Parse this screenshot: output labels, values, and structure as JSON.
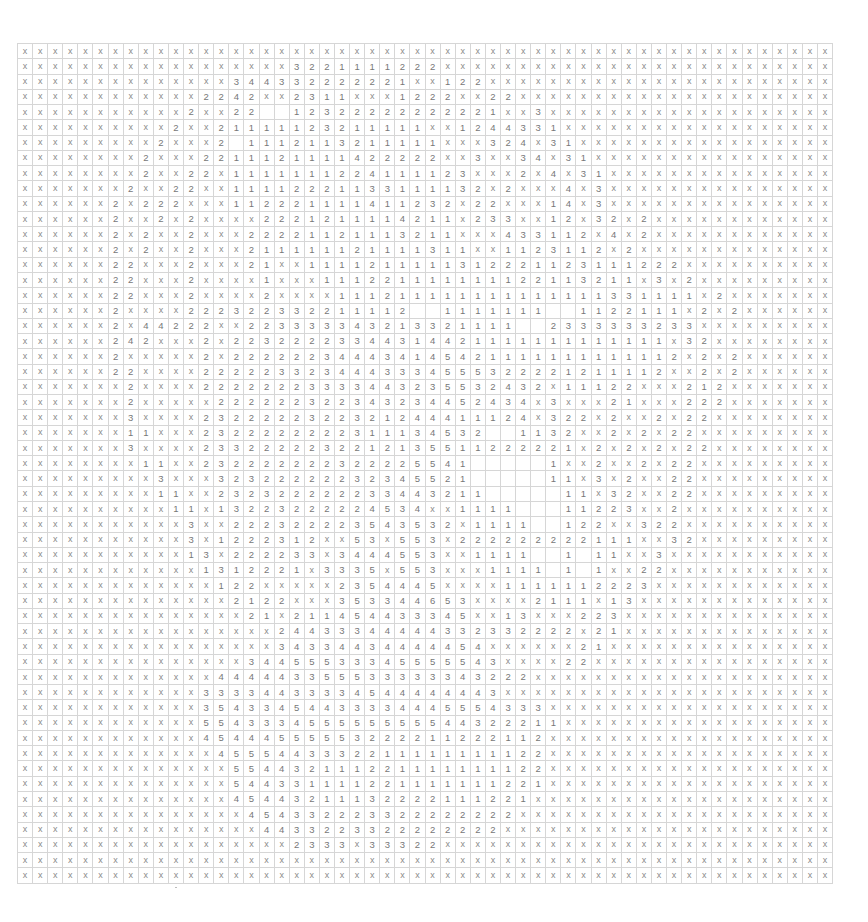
{
  "grid": {
    "columns": 54,
    "rows_count": 55,
    "empty_token": "_",
    "rows": [
      "x x x x x x x x x x x x x x x x x x x x x x x x x x x x x x x x x x x x x x x x x x x x x x x x x x x x x x",
      "x x x x x x x x x x x x x x x x x x 3 2 2 1 1 1 1 2 2 2 x x x x x x x x x x x x x x x x x x x x x x x x x x",
      "x x x x x x x x x x x x x x 3 4 4 3 3 2 2 2 2 2 2 1 x x 1 2 2 x x x x x x x x x x x x x x x x x x x x x x x",
      "x x x x x x x x x x x x 2 2 4 2 x x 2 3 1 1 x x x 1 2 2 2 x x 2 2 x x x x x x x x x x x x x x x x x x x x x",
      "x x x x x x x x x x x 2 x x 2 2 _ _ 1 2 3 2 2 2 2 2 2 2 2 2 2 1 x x 3 x x x x x x x x x x x x x x x x x x x",
      "x x x x x x x x x x 2 x x 2 1 1 1 1 1 2 3 2 1 1 1 1 1 x x 1 2 4 4 3 3 1 x x x x x x x x x x x x x x x x x x",
      "x x x x x x x x x 2 x x x 2 _ 1 1 1 2 1 1 3 2 1 1 1 1 1 x x x 3 2 4 x 3 1 x x x x x x x x x x x x x x x x x",
      "x x x x x x x x 2 x x x 2 2 1 1 1 2 1 1 1 1 4 2 2 2 2 2 x x 3 x x 3 4 x 3 1 x x x x x x x x x x x x x x x x",
      "x x x x x x x x 2 x x 2 2 x 1 1 1 1 1 1 1 2 2 4 1 1 1 1 2 3 x x x 2 x 4 x 3 1 x x x x x x x x x x x x x x x",
      "x x x x x x x 2 x x 2 2 x x 1 1 1 1 2 2 2 1 1 3 3 1 1 1 1 3 2 x 2 x x x 4 x 3 x x x x x x x x x x x x x x x",
      "x x x x x x 2 x 2 2 2 x x x 1 1 2 2 2 1 1 1 1 4 1 1 2 3 2 x 2 2 x x x 1 4 x 3 x x x x x x x x x x x x x x x",
      "x x x x x x 2 x x 2 x 2 x x x x 2 2 2 1 2 1 1 1 1 4 2 1 1 x 2 3 3 x x 1 2 x 3 2 x 2 x x x x x x x x x x x x",
      "x x x x x x 2 x 2 x x 2 x x x 2 2 2 2 1 1 2 1 1 1 3 2 1 1 x x x 4 3 3 1 1 2 x 4 x 2 x x x x x x x x x x x x",
      "x x x x x x 2 x 2 x x 2 x x x 2 1 1 1 1 1 1 2 1 1 1 1 3 1 1 x x 1 1 2 3 1 1 2 x 2 x x x x x x x x x x x x x",
      "x x x x x x 2 2 x x x 2 x x x 2 1 x x 1 1 1 1 2 1 1 1 1 1 3 1 2 2 2 1 1 2 3 1 1 1 2 2 2 x x x x x x x x x x",
      "x x x x x x 2 2 x x x 2 x x x x 1 x x x 1 1 1 2 2 1 1 1 1 1 1 1 1 2 2 1 1 3 2 1 1 x 3 x 2 x x x x x x x x x",
      "x x x x x x 2 2 x x x 2 x x x x 2 x x x x 1 1 1 2 1 1 1 1 1 1 1 1 1 1 1 1 1 1 3 3 1 1 1 1 x 2 x x x x x x x",
      "x x x x x x 2 x x x x 2 2 2 3 2 2 3 3 2 2 1 1 1 1 2 _ _ 1 1 1 1 1 1 1 _ _ 1 1 2 2 1 1 1 x 2 x 2 x x x x x x",
      "x x x x x x 2 x 4 4 2 2 2 x x 2 2 3 3 3 3 3 4 3 2 1 3 3 2 1 1 1 1 _ _ 2 3 3 3 3 3 3 2 3 3 x x x x x x x x x",
      "x x x x x x 2 4 2 x x x 2 x 2 2 3 2 2 2 2 3 3 4 4 3 1 4 4 2 1 1 1 1 1 1 1 1 1 1 1 1 1 x 3 2 x x x x x x x x",
      "x x x x x x 2 x x x x x 2 x 2 2 2 2 2 2 3 4 4 4 3 4 1 4 5 4 2 1 1 1 1 1 1 1 1 1 1 1 1 2 x 2 x 2 x x x x x x",
      "x x x x x x 2 2 x x x x 2 2 2 2 2 3 3 2 3 4 4 4 3 3 3 4 5 5 5 3 2 2 2 2 1 2 1 1 1 1 2 x x 2 x 2 x x x x x x",
      "x x x x x x x 2 x x x x 2 2 2 2 2 2 2 3 3 3 3 4 4 3 2 3 5 5 3 2 4 3 2 x 1 1 1 2 2 x x x 2 1 2 x x x x x x x",
      "x x x x x x x 2 x x x x x 2 2 2 2 2 2 3 2 2 3 4 3 2 3 4 4 5 2 4 3 4 x 3 x x x 2 1 x x x 2 2 2 x x x x x x x",
      "x x x x x x x 3 x x x x 2 3 2 2 2 2 2 3 2 2 3 2 1 2 4 4 4 1 1 1 2 4 x 3 2 2 x 2 x x 2 x 2 2 x x x x x x x x",
      "x x x x x x x 1 1 x x x 2 3 2 2 2 2 2 2 2 2 3 1 1 1 3 4 5 3 2 _ _ 1 1 3 2 x x 2 x 2 x 2 2 x x x x x x x x x",
      "x x x x x x x 3 x x x x 2 3 3 2 2 2 2 2 3 2 2 1 2 1 3 5 5 1 1 2 2 2 2 2 1 x 2 x 2 x 2 x 2 2 x x x x x x x x",
      "x x x x x x x x 1 1 x x 2 3 2 2 2 2 2 2 2 3 2 2 2 2 5 5 4 1 _ _ _ _ _ 1 x x 2 x x 2 x 2 2 x x x x x x x x x",
      "x x x x x x x x x 3 x x x 3 2 3 2 2 2 2 2 2 3 2 3 4 5 5 2 1 _ _ _ _ _ 1 1 x 3 x 2 x x 2 2 x x x x x x x x x",
      "x x x x x x x x x 1 1 x x 2 3 2 3 2 2 2 2 2 2 3 3 4 4 3 2 1 1 _ _ _ _ _ 1 1 x 3 2 x x 2 2 x x x x x x x x x",
      "x x x x x x x x x x 1 1 x 1 3 2 2 3 2 2 2 2 2 4 5 3 4 x x 1 1 1 1 _ _ _ 1 1 2 2 3 x x 2 x x x x x x x x x x",
      "x x x x x x x x x x x 3 x x 2 2 2 3 2 2 2 2 3 5 4 3 5 3 2 x 1 1 1 1 _ _ 1 2 2 x x 3 2 2 x x x x x x x x x x",
      "x x x x x x x x x x x 3 x 1 2 2 2 3 1 2 x x 5 3 x 5 5 3 x 2 2 2 2 2 2 2 2 2 1 1 1 x x 3 2 x x x x x x x x x",
      "x x x x x x x x x x x 1 3 x 2 2 2 2 3 3 x 3 4 4 4 5 5 3 x x 1 1 1 1 _ _ 1 _ 1 1 x x 3 x x x x x x x x x x x",
      "x x x x x x x x x x x x 1 3 1 2 2 2 1 x 3 3 3 5 x 5 5 3 x x x 1 1 1 1 _ 1 _ 1 x x 2 2 x x x x x x x x x x x",
      "x x x x x x x x x x x x x 1 2 2 x x x x x 2 3 5 4 4 4 5 x x x x 1 1 1 1 1 1 2 2 2 3 x x x x x x x x x x x x",
      "x x x x x x x x x x x x x x 2 1 2 2 x x x 3 5 3 3 4 4 6 5 3 x x x x 2 1 1 1 x 1 3 x x x x x x x x x x x x x",
      "x x x x x x x x x x x x x x x 2 1 x 2 1 1 4 5 4 4 3 3 3 4 5 x x 1 3 x x x 2 2 3 x x x x x x x x x x x x x x",
      "x x x x x x x x x x x x x x x x x 2 4 4 3 3 3 4 4 4 4 4 3 3 2 3 3 2 2 2 2 x 2 1 x x x x x x x x x x x x x x",
      "x x x x x x x x x x x x x x x x x 3 4 3 3 4 4 3 4 4 4 4 4 5 4 x x x x x x 2 1 x x x x x x x x x x x x x x x",
      "x x x x x x x x x x x x x x x 3 4 4 5 5 5 3 3 3 4 5 5 5 5 5 4 3 x x x x 2 2 x x x x x x x x x x x x x x x x",
      "x x x x x x x x x x x x x 4 4 4 4 4 3 3 5 5 5 3 3 3 3 3 3 4 3 2 2 2 x x x x x x x x x x x x x x x x x x x x",
      "x x x x x x x x x x x x 3 3 3 3 4 4 3 3 3 3 4 5 4 4 4 4 4 4 4 3 x x x x x x x x x x x x x x x x x x x x x x",
      "x x x x x x x x x x x x 3 5 4 3 3 4 5 4 4 3 3 3 3 4 4 4 5 5 5 4 3 3 3 x x x x x x x x x x x x x x x x x x x",
      "x x x x x x x x x x x x 5 5 4 3 3 3 4 5 5 5 5 5 5 5 5 5 4 4 3 2 2 2 1 1 x x x x x x x x x x x x x x x x x x",
      "x x x x x x x x x x x x 4 5 4 4 4 5 5 5 5 5 3 2 2 2 2 1 1 2 2 2 1 1 2 x x x x x x x x x x x x x x x x x x x",
      "x x x x x x x x x x x x x 4 5 5 5 4 4 3 3 3 2 2 1 1 1 1 1 1 1 1 1 2 2 x x x x x x x x x x x x x x x x x x x",
      "x x x x x x x x x x x x x x 5 5 4 4 3 2 1 1 1 2 2 1 1 1 1 1 1 1 1 2 2 x x x x x x x x x x x x x x x x x x x",
      "x x x x x x x x x x x x x x 5 4 4 3 3 1 1 1 1 2 2 1 1 1 1 1 1 1 2 2 1 x x x x x x x x x x x x x x x x x x x",
      "x x x x x x x x x x x x x x 4 5 4 4 3 2 1 1 1 3 2 2 2 2 1 1 1 2 2 1 x x x x x x x x x x x x x x x x x x x x",
      "x x x x x x x x x x x x x x x 4 5 4 3 3 2 2 2 3 3 2 2 2 2 2 2 2 2 x x x x x x x x x x x x x x x x x x x x x",
      "x x x x x x x x x x x x x x x x 4 4 3 3 2 2 3 3 2 2 2 2 2 2 2 2 x x x x x x x x x x x x x x x x x x x x x x",
      "x x x x x x x x x x x x x x x x x x 2 3 3 3 x 3 3 3 2 2 x x x x x x x x x x x x x x x x x x x x x x x x x x",
      "x x x x x x x x x x x x x x x x x x x x x x x x x x x x x x x x x x x x x x x x x x x x x x x x x x x x x x",
      "x x x x x x x x x x x x x x x x x x x x x x x x x x x x x x x x x x x x x x x x x x x x x x x x x x x x x x"
    ]
  }
}
